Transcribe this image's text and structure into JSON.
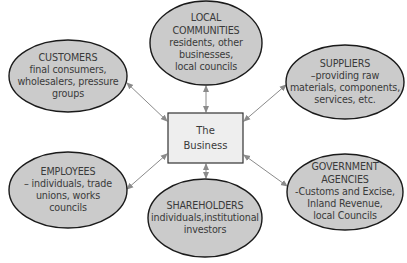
{
  "colors": {
    "ellipse_fill": "#cbcbcb",
    "ellipse_stroke": "#1a1a1a",
    "box_fill": "#eeeeee",
    "box_stroke": "#333333",
    "arrow": "#8a8a8a",
    "text": "#3a3a3a"
  },
  "center": {
    "lines": [
      "The",
      "Business"
    ]
  },
  "stakeholders": [
    {
      "id": "customers",
      "title": "CUSTOMERS",
      "lines": [
        "final consumers,",
        "wholesalers, pressure",
        "groups"
      ]
    },
    {
      "id": "local-communities",
      "title": "LOCAL",
      "lines": [
        "COMMUNITIES",
        "residents, other",
        "businesses,",
        "local councils"
      ]
    },
    {
      "id": "suppliers",
      "title": "SUPPLIERS",
      "lines": [
        "–providing raw",
        "materials, components,",
        "services, etc."
      ]
    },
    {
      "id": "employees",
      "title": "EMPLOYEES",
      "lines": [
        "– individuals, trade",
        "unions, works",
        "councils"
      ]
    },
    {
      "id": "shareholders",
      "title": "SHAREHOLDERS",
      "lines": [
        "individuals,institutional",
        "investors"
      ]
    },
    {
      "id": "government-agencies",
      "title": "GOVERNMENT",
      "lines": [
        "AGENCIES",
        "-Customs and Excise,",
        "Inland Revenue,",
        "local Councils"
      ]
    }
  ]
}
